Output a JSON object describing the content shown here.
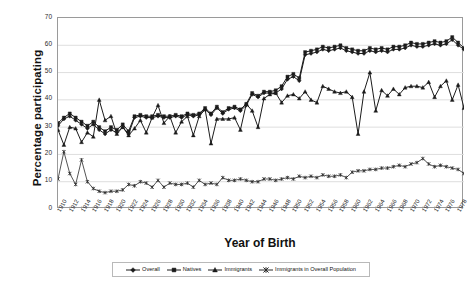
{
  "chart_data": {
    "type": "line",
    "title": "",
    "xlabel": "Year of Birth",
    "ylabel": "Percentage participating",
    "ylim": [
      0,
      70
    ],
    "yticks": [
      0,
      10,
      20,
      30,
      40,
      50,
      60,
      70
    ],
    "grid": "horizontal",
    "legend_position": "bottom",
    "x": [
      1910,
      1911,
      1912,
      1913,
      1914,
      1915,
      1916,
      1917,
      1918,
      1919,
      1920,
      1921,
      1922,
      1923,
      1924,
      1925,
      1926,
      1927,
      1928,
      1929,
      1930,
      1931,
      1932,
      1933,
      1934,
      1935,
      1936,
      1937,
      1938,
      1939,
      1940,
      1941,
      1942,
      1943,
      1944,
      1945,
      1946,
      1947,
      1948,
      1949,
      1950,
      1951,
      1952,
      1953,
      1954,
      1955,
      1956,
      1957,
      1958,
      1959,
      1960,
      1961,
      1962,
      1963,
      1964,
      1965,
      1966,
      1967,
      1968,
      1969,
      1970,
      1971,
      1972,
      1973,
      1974,
      1975,
      1976,
      1977,
      1978,
      1979
    ],
    "xtick_labels": [
      "1910",
      "1912",
      "1914",
      "1916",
      "1918",
      "1920",
      "1922",
      "1924",
      "1926",
      "1928",
      "1930",
      "1932",
      "1934",
      "1936",
      "1938",
      "1940",
      "1942",
      "1944",
      "1946",
      "1948",
      "1950",
      "1952",
      "1954",
      "1956",
      "1958",
      "1960",
      "1962",
      "1964",
      "1966",
      "1968",
      "1970",
      "1972",
      "1974",
      "1976",
      "1978"
    ],
    "xtick_step": 2,
    "series": [
      {
        "name": "Overall",
        "marker": "diamond",
        "color": "#1b1b1b",
        "values": [
          30.5,
          33.0,
          34.0,
          32.5,
          31.0,
          29.5,
          31.0,
          29.0,
          27.5,
          29.0,
          28.0,
          30.0,
          27.5,
          33.5,
          34.0,
          33.5,
          33.5,
          34.0,
          33.5,
          33.5,
          34.0,
          33.5,
          34.5,
          34.0,
          34.5,
          36.5,
          34.5,
          37.0,
          35.0,
          36.5,
          37.0,
          36.0,
          38.0,
          42.0,
          41.0,
          42.5,
          42.5,
          42.5,
          44.0,
          47.5,
          48.5,
          47.0,
          56.5,
          57.0,
          57.5,
          58.5,
          58.0,
          58.5,
          59.0,
          58.0,
          57.5,
          57.0,
          57.0,
          58.0,
          57.5,
          58.0,
          57.5,
          58.5,
          58.5,
          59.0,
          60.0,
          59.5,
          59.5,
          60.0,
          60.5,
          60.0,
          60.5,
          62.0,
          60.0,
          58.5
        ]
      },
      {
        "name": "Natives",
        "marker": "square",
        "color": "#1b1b1b",
        "values": [
          31.5,
          33.5,
          35.0,
          33.5,
          32.0,
          30.5,
          32.0,
          30.0,
          28.5,
          30.0,
          29.0,
          31.0,
          28.5,
          34.0,
          34.5,
          34.0,
          34.0,
          34.5,
          34.0,
          34.0,
          34.5,
          34.0,
          35.0,
          34.5,
          35.0,
          37.0,
          35.0,
          37.5,
          35.5,
          37.0,
          37.5,
          36.5,
          38.5,
          42.5,
          41.5,
          43.0,
          43.0,
          43.5,
          45.0,
          48.5,
          49.5,
          48.0,
          57.5,
          58.0,
          58.5,
          59.5,
          59.0,
          59.5,
          60.0,
          59.0,
          58.5,
          58.0,
          58.0,
          59.0,
          58.5,
          59.0,
          58.5,
          59.5,
          59.5,
          60.0,
          61.0,
          60.5,
          60.5,
          61.0,
          61.5,
          61.0,
          61.5,
          63.0,
          61.0,
          59.0
        ]
      },
      {
        "name": "Immigrants",
        "marker": "triangle",
        "color": "#1b1b1b",
        "values": [
          29.0,
          23.5,
          30.0,
          29.5,
          24.5,
          28.0,
          26.5,
          40.0,
          32.5,
          34.0,
          27.5,
          30.0,
          27.0,
          29.5,
          32.5,
          28.0,
          33.5,
          38.0,
          31.5,
          34.0,
          28.0,
          32.0,
          34.0,
          27.0,
          34.0,
          36.5,
          24.0,
          33.0,
          33.0,
          33.0,
          33.5,
          29.0,
          38.5,
          36.0,
          30.0,
          40.5,
          42.0,
          42.5,
          39.0,
          41.5,
          42.0,
          40.5,
          43.0,
          40.0,
          39.0,
          45.0,
          44.0,
          43.0,
          42.5,
          43.0,
          41.0,
          27.5,
          43.0,
          50.0,
          36.0,
          43.5,
          41.5,
          44.0,
          42.0,
          44.5,
          45.0,
          45.0,
          44.5,
          46.5,
          41.0,
          45.0,
          47.0,
          40.0,
          45.5,
          37.0
        ]
      },
      {
        "name": "Immigrants in Overall Population",
        "marker": "star",
        "color": "#2a2a2a",
        "values": [
          11.0,
          21.0,
          13.0,
          9.0,
          18.0,
          10.0,
          7.5,
          6.5,
          6.0,
          6.5,
          6.5,
          7.0,
          9.0,
          8.5,
          10.0,
          9.5,
          8.0,
          10.5,
          8.0,
          9.5,
          9.0,
          9.0,
          9.5,
          8.0,
          10.5,
          9.0,
          9.5,
          9.0,
          11.5,
          10.5,
          10.5,
          11.0,
          10.5,
          10.0,
          10.0,
          11.0,
          11.0,
          10.5,
          11.0,
          11.5,
          11.0,
          12.0,
          11.5,
          12.0,
          11.5,
          12.5,
          12.0,
          12.0,
          12.5,
          11.5,
          13.5,
          14.0,
          14.0,
          14.5,
          14.5,
          15.0,
          15.0,
          15.5,
          16.0,
          15.5,
          16.5,
          17.0,
          18.5,
          16.5,
          15.5,
          16.0,
          15.5,
          15.0,
          14.5,
          13.0
        ]
      }
    ]
  }
}
